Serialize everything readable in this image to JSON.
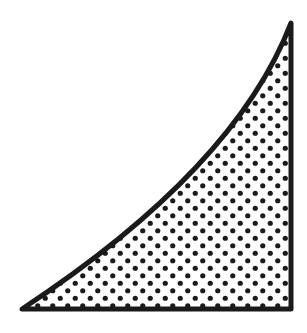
{
  "figure": {
    "colors": {
      "background": "#ffffff",
      "stroke": "#1a1a1a",
      "dots": "#1a1a1a"
    },
    "shape": {
      "bottom_left": [
        22,
        309
      ],
      "bottom_right": [
        291,
        309
      ],
      "top_right": [
        291,
        23
      ],
      "curve_control_1": [
        150,
        225
      ],
      "curve_control_2": [
        250,
        130
      ],
      "stroke_width": 5
    },
    "pattern": {
      "spacing_x": 15,
      "spacing_y": 15,
      "dot_radius": 2.6
    }
  }
}
